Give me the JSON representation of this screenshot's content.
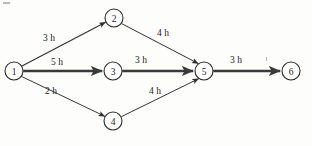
{
  "diagram": {
    "background_color": "#fdfdfc",
    "line_color": "#2e2e2e",
    "node_fill": "#ffffff",
    "nodes": [
      {
        "id": "1",
        "label": "1",
        "x": 14,
        "y": 71,
        "r": 9
      },
      {
        "id": "2",
        "label": "2",
        "x": 114,
        "y": 18,
        "r": 9
      },
      {
        "id": "3",
        "label": "3",
        "x": 113,
        "y": 71,
        "r": 9
      },
      {
        "id": "4",
        "label": "4",
        "x": 113,
        "y": 121,
        "r": 9
      },
      {
        "id": "5",
        "label": "5",
        "x": 204,
        "y": 71,
        "r": 9
      },
      {
        "id": "6",
        "label": "6",
        "x": 291,
        "y": 71,
        "r": 9
      }
    ],
    "edges": [
      {
        "id": "e1-2",
        "from": "1",
        "to": "2",
        "label": "3 h",
        "label_x": 49,
        "label_y": 38,
        "weight": "thin"
      },
      {
        "id": "e1-3",
        "from": "1",
        "to": "3",
        "label": "5 h",
        "label_x": 57,
        "label_y": 62,
        "weight": "thick"
      },
      {
        "id": "e1-4",
        "from": "1",
        "to": "4",
        "label": "2 h",
        "label_x": 51,
        "label_y": 91,
        "weight": "thin"
      },
      {
        "id": "e2-5",
        "from": "2",
        "to": "5",
        "label": "4 h",
        "label_x": 163,
        "label_y": 33,
        "weight": "thin"
      },
      {
        "id": "e3-5",
        "from": "3",
        "to": "5",
        "label": "3 h",
        "label_x": 141,
        "label_y": 60,
        "weight": "thick"
      },
      {
        "id": "e4-5",
        "from": "4",
        "to": "5",
        "label": "4 h",
        "label_x": 155,
        "label_y": 91,
        "weight": "thin"
      },
      {
        "id": "e5-6",
        "from": "5",
        "to": "6",
        "label": "3 h",
        "label_x": 236,
        "label_y": 60,
        "weight": "thick"
      }
    ]
  }
}
